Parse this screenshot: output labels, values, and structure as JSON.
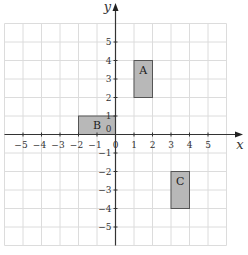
{
  "chart_data": {
    "type": "coordinate-grid",
    "title": "",
    "xlabel": "x",
    "ylabel": "y",
    "xlim": [
      -6,
      6
    ],
    "ylim": [
      -6,
      6
    ],
    "grid": true,
    "x_ticks": [
      -5,
      -4,
      -3,
      -2,
      -1,
      0,
      1,
      2,
      3,
      4,
      5
    ],
    "y_ticks": [
      5,
      4,
      3,
      2,
      1,
      -1,
      -2,
      -3,
      -4,
      -5
    ],
    "shapes": [
      {
        "label": "A",
        "x1": 1,
        "y1": 2,
        "x2": 2,
        "y2": 4,
        "fill": "#b8b8b8"
      },
      {
        "label": "B",
        "x1": -2,
        "y1": 0,
        "x2": 0,
        "y2": 1,
        "fill": "#b8b8b8"
      },
      {
        "label": "C",
        "x1": 3,
        "y1": -4,
        "x2": 4,
        "y2": -2,
        "fill": "#b8b8b8"
      }
    ]
  },
  "labels": {
    "x_axis": "x",
    "y_axis": "y",
    "origin": "0",
    "shape_a": "A",
    "shape_b": "B",
    "shape_c": "C"
  }
}
